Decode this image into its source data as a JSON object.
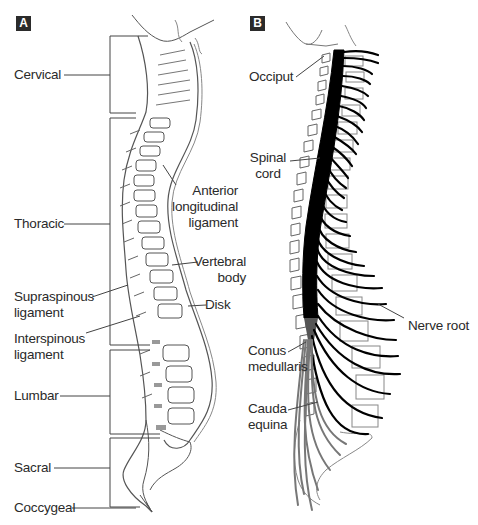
{
  "panels": {
    "a": {
      "tag": "A",
      "title": "Regions and ligaments of the vertebral column",
      "regions": {
        "cervical": "Cervical",
        "thoracic": "Thoracic",
        "lumbar": "Lumbar",
        "sacral": "Sacral",
        "coccygeal": "Coccygeal"
      },
      "structures": {
        "anterior_longitudinal_ligament": [
          "Anterior",
          "longitudinal",
          "ligament"
        ],
        "vertebral_body": [
          "Vertebral",
          "body"
        ],
        "disk": [
          "Disk"
        ],
        "supraspinous_ligament": [
          "Supraspinous",
          "ligament"
        ],
        "interspinous_ligament": [
          "Interspinous",
          "ligament"
        ]
      }
    },
    "b": {
      "tag": "B",
      "title": "Spinal cord and nerve roots",
      "structures": {
        "occiput": [
          "Occiput"
        ],
        "spinal_cord": [
          "Spinal",
          "cord"
        ],
        "nerve_root": [
          "Nerve root"
        ],
        "conus_medullaris": [
          "Conus",
          "medullaris"
        ],
        "cauda_equina": [
          "Cauda",
          "equina"
        ]
      }
    }
  },
  "colors": {
    "panel_tag_bg": "#2b2b2b",
    "line_art": "#555555",
    "spinal_cord": "#000000",
    "cauda_equina": "#777777",
    "label_text": "#2a2a2a"
  }
}
